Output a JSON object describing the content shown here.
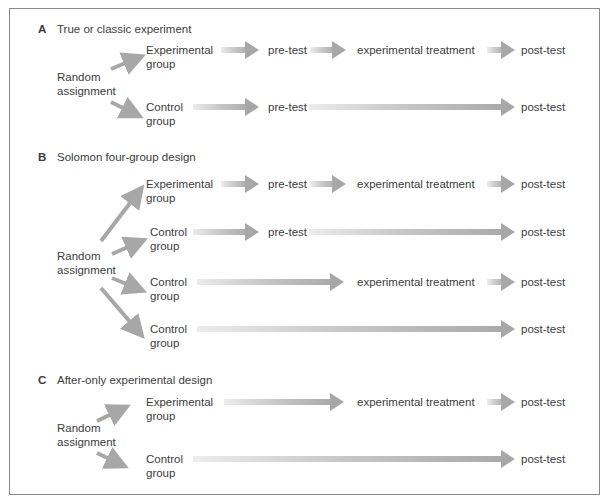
{
  "sections": [
    {
      "letter": "A",
      "title": "True or classic experiment",
      "assignment_label": [
        "Random",
        "assignment"
      ],
      "rows": [
        {
          "group": [
            "Experimental",
            "group"
          ],
          "steps": [
            "pre-test",
            "experimental treatment",
            "post-test"
          ]
        },
        {
          "group": [
            "Control",
            "group"
          ],
          "steps": [
            "pre-test",
            "post-test"
          ]
        }
      ]
    },
    {
      "letter": "B",
      "title": "Solomon four-group design",
      "assignment_label": [
        "Random",
        "assignment"
      ],
      "rows": [
        {
          "group": [
            "Experimental",
            "group"
          ],
          "steps": [
            "pre-test",
            "experimental treatment",
            "post-test"
          ]
        },
        {
          "group": [
            "Control",
            "group"
          ],
          "steps": [
            "pre-test",
            "post-test"
          ]
        },
        {
          "group": [
            "Control",
            "group"
          ],
          "steps": [
            "experimental treatment",
            "post-test"
          ]
        },
        {
          "group": [
            "Control",
            "group"
          ],
          "steps": [
            "post-test"
          ]
        }
      ]
    },
    {
      "letter": "C",
      "title": "After-only experimental design",
      "assignment_label": [
        "Random",
        "assignment"
      ],
      "rows": [
        {
          "group": [
            "Experimental",
            "group"
          ],
          "steps": [
            "experimental treatment",
            "post-test"
          ]
        },
        {
          "group": [
            "Control",
            "group"
          ],
          "steps": [
            "post-test"
          ]
        }
      ]
    }
  ],
  "colors": {
    "arrow": "#a7a7a7",
    "arrow_light": "#ececec",
    "text": "#3c3c3c",
    "frame": "#8a8a8a"
  }
}
